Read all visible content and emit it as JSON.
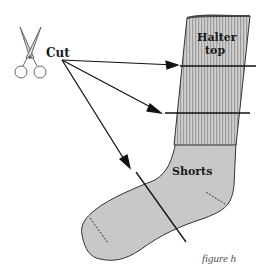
{
  "figure": {
    "labels": {
      "cut": "Cut",
      "halter_top_line1": "Halter",
      "halter_top_line2": "top",
      "shorts": "Shorts"
    },
    "caption": "figure h",
    "icons": {
      "scissors": "scissors-icon"
    },
    "colors": {
      "sock_fill": "#c8c8c8",
      "rib_stripe": "#a8a8a8",
      "outline": "#333333",
      "line": "#111111"
    }
  }
}
